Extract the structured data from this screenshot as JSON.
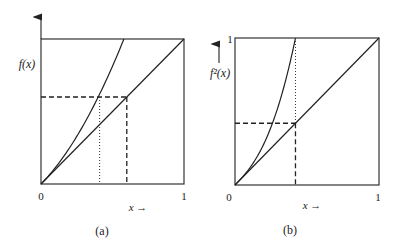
{
  "panels": [
    {
      "id": "a",
      "caption": "(a)",
      "y_label": "f(x)",
      "x_label": "x →",
      "origin_label": "0",
      "x_end_label": "1",
      "y_end_label": "",
      "curve": {
        "name": "f",
        "coef": 1.25
      },
      "intersection": {
        "x": 0.6,
        "y": 0.6
      },
      "dotted_x": 0.41,
      "has_up_arrow_on_axis": true
    },
    {
      "id": "b",
      "caption": "(b)",
      "y_label": "f²(x)",
      "x_label": "x →",
      "origin_label": "0",
      "x_end_label": "1",
      "y_end_label": "1",
      "curve": {
        "name": "f2",
        "reach_one_at": 0.42,
        "through": [
          0.26,
          0.42
        ]
      },
      "intersection": {
        "x": 0.42,
        "y": 0.42
      },
      "dotted_x": 0.42,
      "has_up_arrow_on_axis": false
    }
  ]
}
